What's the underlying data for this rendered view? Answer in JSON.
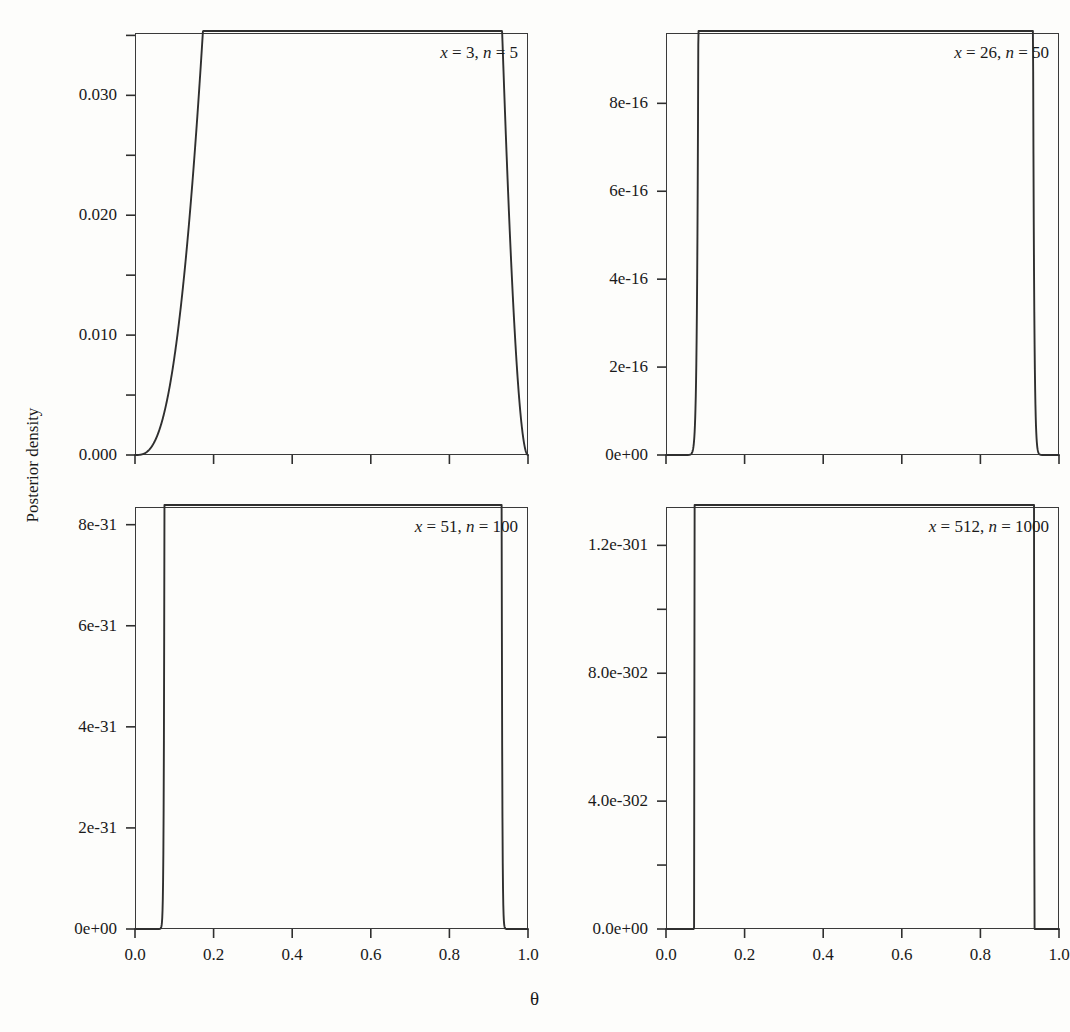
{
  "figure": {
    "caption_sliver": "",
    "axis_titles": {
      "y": "Posterior density",
      "x": "θ"
    }
  },
  "chart_data": [
    {
      "type": "line",
      "id": "panel-x3-n5",
      "title": "",
      "annotation": {
        "x_label": "x",
        "x_value": "3",
        "n_label": "n",
        "n_value": "5",
        "text": "x = 3, n = 5"
      },
      "xlabel": "θ",
      "ylabel": "Posterior density",
      "xlim": [
        0,
        1
      ],
      "ylim": [
        0,
        0.0352
      ],
      "xticks": [
        0.0,
        0.2,
        0.4,
        0.6,
        0.8,
        1.0
      ],
      "xticklabels": [
        "0.0",
        "0.2",
        "0.4",
        "0.6",
        "0.8",
        "1.0"
      ],
      "yticks": [
        0.0,
        0.01,
        0.02,
        0.03
      ],
      "yticklabels": [
        "0.000",
        "0.010",
        "0.020",
        "0.030"
      ],
      "yminorticks": [
        0.005,
        0.015,
        0.025,
        0.035
      ],
      "grid": false,
      "legend": "none",
      "distribution": "beta-likelihood, x=3, n=5",
      "peak_x": 0.6,
      "peak_y": 0.0346,
      "x": [
        0.0,
        0.02,
        0.04,
        0.06,
        0.08,
        0.1,
        0.12,
        0.14,
        0.16,
        0.18,
        0.2,
        0.22,
        0.24,
        0.26,
        0.28,
        0.3,
        0.32,
        0.34,
        0.36,
        0.38,
        0.4,
        0.42,
        0.44,
        0.46,
        0.48,
        0.5,
        0.52,
        0.54,
        0.56,
        0.58,
        0.6,
        0.62,
        0.64,
        0.66,
        0.68,
        0.7,
        0.72,
        0.74,
        0.76,
        0.78,
        0.8,
        0.82,
        0.84,
        0.86,
        0.88,
        0.9,
        0.92,
        0.94,
        0.96,
        0.98,
        1.0
      ],
      "y": [
        0.0,
        1e-05,
        6e-05,
        0.00019,
        0.00042,
        0.00081,
        0.00137,
        0.00214,
        0.00314,
        0.00438,
        0.00589,
        0.00766,
        0.00971,
        0.01203,
        0.01462,
        0.01746,
        0.02053,
        0.02381,
        0.02727,
        0.03086,
        0.03456,
        0.03829,
        0.042,
        0.04561,
        0.04905,
        0.05222,
        0.05504,
        0.05741,
        0.05924,
        0.06042,
        0.06087,
        0.06048,
        0.05918,
        0.0569,
        0.05359,
        0.04922,
        0.0438,
        0.03737,
        0.03002,
        0.02191,
        0.01331,
        0.00458,
        0.0,
        0.0,
        0.0,
        0.0,
        0.0,
        0.0,
        0.0,
        0.0,
        0.0
      ]
    },
    {
      "type": "line",
      "id": "panel-x26-n50",
      "title": "",
      "annotation": {
        "x_label": "x",
        "x_value": "26",
        "n_label": "n",
        "n_value": "50",
        "text": "x = 26, n = 50"
      },
      "xlabel": "θ",
      "ylabel": "Posterior density",
      "xlim": [
        0,
        1
      ],
      "ylim": [
        0,
        9.6e-16
      ],
      "xticks": [
        0.0,
        0.2,
        0.4,
        0.6,
        0.8,
        1.0
      ],
      "xticklabels": [
        "0.0",
        "0.2",
        "0.4",
        "0.6",
        "0.8",
        "1.0"
      ],
      "yticks": [
        0,
        2e-16,
        4e-16,
        6e-16,
        8e-16
      ],
      "yticklabels": [
        "0e+00",
        "2e-16",
        "4e-16",
        "6e-16",
        "8e-16"
      ],
      "yminorticks": [],
      "grid": false,
      "legend": "none",
      "distribution": "beta-likelihood, x=26, n=50",
      "peak_x": 0.52,
      "peak_y": 9.25e-16
    },
    {
      "type": "line",
      "id": "panel-x51-n100",
      "title": "",
      "annotation": {
        "x_label": "x",
        "x_value": "51",
        "n_label": "n",
        "n_value": "100",
        "text": "x = 51, n = 100"
      },
      "xlabel": "θ",
      "ylabel": "Posterior density",
      "xlim": [
        0,
        1
      ],
      "ylim": [
        0,
        8.35e-31
      ],
      "xticks": [
        0.0,
        0.2,
        0.4,
        0.6,
        0.8,
        1.0
      ],
      "xticklabels": [
        "0.0",
        "0.2",
        "0.4",
        "0.6",
        "0.8",
        "1.0"
      ],
      "yticks": [
        0,
        2e-31,
        4e-31,
        6e-31,
        8e-31
      ],
      "yticklabels": [
        "0e+00",
        "2e-31",
        "4e-31",
        "6e-31",
        "8e-31"
      ],
      "yminorticks": [],
      "grid": false,
      "legend": "none",
      "distribution": "beta-likelihood, x=51, n=100",
      "peak_x": 0.51,
      "peak_y": 8e-31
    },
    {
      "type": "line",
      "id": "panel-x512-n1000",
      "title": "",
      "annotation": {
        "x_label": "x",
        "x_value": "512",
        "n_label": "n",
        "n_value": "1000",
        "text": "x = 512, n = 1000"
      },
      "xlabel": "θ",
      "ylabel": "Posterior density",
      "xlim": [
        0,
        1
      ],
      "ylim": [
        0,
        1.32e-301
      ],
      "xticks": [
        0.0,
        0.2,
        0.4,
        0.6,
        0.8,
        1.0
      ],
      "xticklabels": [
        "0.0",
        "0.2",
        "0.4",
        "0.6",
        "0.8",
        "1.0"
      ],
      "yticks": [
        0,
        4e-302,
        8e-302,
        1.2e-301
      ],
      "yticklabels": [
        "0.0e+00",
        "4.0e-302",
        "8.0e-302",
        "1.2e-301"
      ],
      "yminorticks": [
        2e-302,
        6e-302,
        1e-301
      ],
      "grid": false,
      "legend": "none",
      "distribution": "beta-likelihood, x=512, n=1000",
      "peak_x": 0.512,
      "peak_y": 1.265e-301
    }
  ]
}
